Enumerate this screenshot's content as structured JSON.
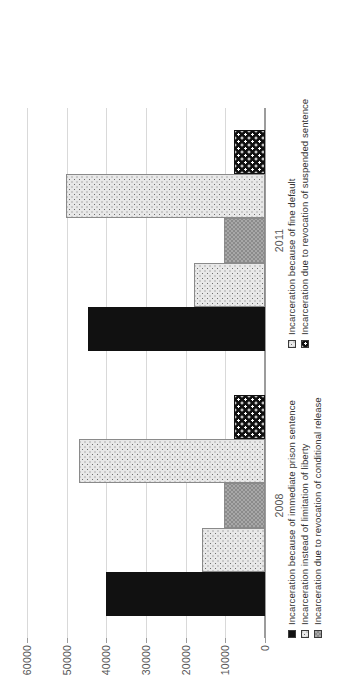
{
  "chart_data": {
    "type": "bar",
    "orientation": "horizontal-rotated",
    "title": "",
    "subtitle": "",
    "xlabel": "",
    "ylabel": "",
    "categories": [
      "2008",
      "2011"
    ],
    "ylim": [
      0,
      60000
    ],
    "yticks": [
      0,
      10000,
      20000,
      30000,
      40000,
      50000,
      60000
    ],
    "ytick_labels": [
      "0",
      "10000",
      "20000",
      "30000",
      "40000",
      "50000",
      "60000"
    ],
    "grid": true,
    "legend_position": "bottom",
    "stacked": false,
    "series": [
      {
        "name": "Incarceration because of immediate prison sentence",
        "swatch": "solid-black",
        "values": [
          40000,
          44500
        ]
      },
      {
        "name": "Incarceration instead of limitation of liberty",
        "swatch": "light-dotted",
        "values": [
          15800,
          17800
        ]
      },
      {
        "name": "Incarceration due to revocation of conditional release",
        "swatch": "medium-grey-check",
        "values": [
          10300,
          10300
        ]
      },
      {
        "name": "Incarceration because of fine default",
        "swatch": "light-dotted",
        "values": [
          47000,
          50200
        ]
      },
      {
        "name": "Incarceration due to revocation of suspended sentence",
        "swatch": "black-white-dots",
        "values": [
          7800,
          7800
        ]
      }
    ]
  },
  "colors": {
    "gridline": "#d9d9d9",
    "axis": "#9c9c9c",
    "tick_text": "#555555",
    "legend_text": "#333333",
    "series_solid_black": "#111111",
    "series_light_dotted": "#e8e8e8",
    "series_medium_grey": "#a8a8a8",
    "background": "#ffffff"
  }
}
